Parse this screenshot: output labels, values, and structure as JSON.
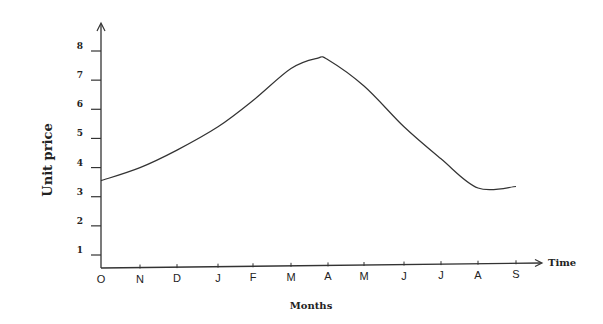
{
  "chart_data": {
    "type": "line",
    "title": "",
    "xlabel": "Months",
    "ylabel": "Unit price",
    "x_axis_end_label": "Time",
    "categories": [
      "O",
      "N",
      "D",
      "J",
      "F",
      "M",
      "A",
      "M",
      "J",
      "J",
      "A",
      "S"
    ],
    "series": [
      {
        "name": "Unit price",
        "values": [
          3.55,
          4.0,
          4.6,
          5.4,
          6.3,
          7.4,
          7.7,
          6.8,
          5.4,
          4.3,
          3.3,
          3.35
        ]
      }
    ],
    "peak": {
      "position_between": [
        "M",
        "A"
      ],
      "value": 7.75
    },
    "yticks": [
      1,
      2,
      3,
      4,
      5,
      6,
      7,
      8
    ],
    "ylim": [
      0.55,
      9
    ],
    "grid": false,
    "legend": "none",
    "line_style": "smooth",
    "line_color": "#333333"
  }
}
